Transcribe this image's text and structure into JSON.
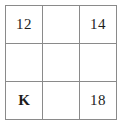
{
  "figure": {
    "kind": "grid-table",
    "rows": 3,
    "columns": 3,
    "border_color": "#8a8a8a",
    "background_color": "#ffffff",
    "text_color": "#1d1d1d"
  },
  "grid": {
    "cells": [
      [
        {
          "text": "12",
          "bold": false,
          "empty": false
        },
        {
          "text": "",
          "bold": false,
          "empty": true
        },
        {
          "text": "14",
          "bold": false,
          "empty": false
        }
      ],
      [
        {
          "text": "",
          "bold": false,
          "empty": true
        },
        {
          "text": "",
          "bold": false,
          "empty": true
        },
        {
          "text": "",
          "bold": false,
          "empty": true
        }
      ],
      [
        {
          "text": "K",
          "bold": true,
          "empty": false
        },
        {
          "text": "",
          "bold": false,
          "empty": true
        },
        {
          "text": "18",
          "bold": false,
          "empty": false
        }
      ]
    ]
  }
}
